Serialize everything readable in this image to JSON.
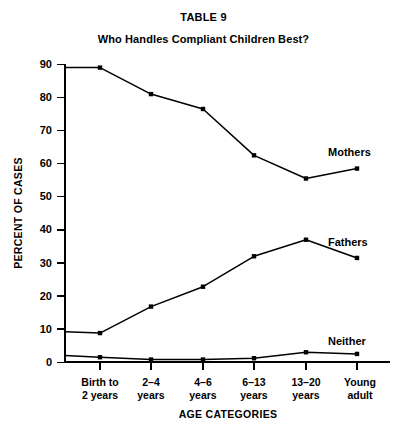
{
  "chart_data": {
    "type": "line",
    "title": "TABLE 9",
    "subtitle": "Who Handles Compliant Children Best?",
    "xlabel": "AGE CATEGORIES",
    "ylabel": "PERCENT OF CASES",
    "categories": [
      "Birth to 2 years",
      "2–4 years",
      "4–6 years",
      "6–13 years",
      "13–20 years",
      "Young adult"
    ],
    "category_lines": [
      [
        "Birth to",
        "2 years"
      ],
      [
        "2–4",
        "years"
      ],
      [
        "4–6",
        "years"
      ],
      [
        "6–13",
        "years"
      ],
      [
        "13–20",
        "years"
      ],
      [
        "Young",
        "adult"
      ]
    ],
    "ylim": [
      0,
      90
    ],
    "yticks": [
      0,
      10,
      20,
      30,
      40,
      50,
      60,
      70,
      80,
      90
    ],
    "ytick_labels": [
      "0",
      "10",
      "20",
      "30",
      "40",
      "50",
      "60",
      "70",
      "80",
      "90"
    ],
    "grid": false,
    "legend_position": "inline-right",
    "series": [
      {
        "name": "Mothers",
        "label": "Mothers",
        "values": [
          89,
          81,
          76.5,
          62.5,
          55.5,
          58.5
        ],
        "start_value": 89,
        "color": "#000000"
      },
      {
        "name": "Fathers",
        "label": "Fathers",
        "values": [
          8.8,
          16.8,
          22.8,
          32,
          37,
          31.5
        ],
        "start_value": 9.2,
        "color": "#000000"
      },
      {
        "name": "Neither",
        "label": "Neither",
        "values": [
          1.5,
          0.8,
          0.8,
          1.2,
          3,
          2.5
        ],
        "start_value": 2,
        "color": "#000000"
      }
    ]
  },
  "labels": {
    "mothers": "Mothers",
    "fathers": "Fathers",
    "neither": "Neither",
    "y_axis_title": "PERCENT OF CASES",
    "x_axis_title": "AGE CATEGORIES"
  }
}
